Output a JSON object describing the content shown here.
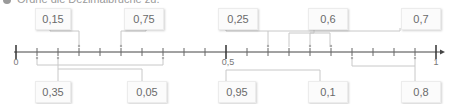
{
  "instruction": {
    "text": "Ordne die Dezimalbrüche zu."
  },
  "number_line": {
    "min": 0,
    "max": 1,
    "tick_step": 0.05,
    "axis_labels": {
      "start": "0",
      "middle": "0,5",
      "end": "1"
    }
  },
  "top_boxes": [
    {
      "label": "0,15",
      "value": 0.15
    },
    {
      "label": "0,75",
      "value": 0.75
    },
    {
      "label": "0,25",
      "value": 0.25
    },
    {
      "label": "0,6",
      "value": 0.6
    },
    {
      "label": "0,7",
      "value": 0.7
    }
  ],
  "bottom_boxes": [
    {
      "label": "0,35",
      "value": 0.35
    },
    {
      "label": "0,05",
      "value": 0.05
    },
    {
      "label": "0,95",
      "value": 0.95
    },
    {
      "label": "0,1",
      "value": 0.1
    },
    {
      "label": "0,8",
      "value": 0.8
    }
  ],
  "colors": {
    "axis": "#444444",
    "connector": "#c8c8c8",
    "marker": "#aaaaaa",
    "box_bg": "#fbfbfb"
  }
}
